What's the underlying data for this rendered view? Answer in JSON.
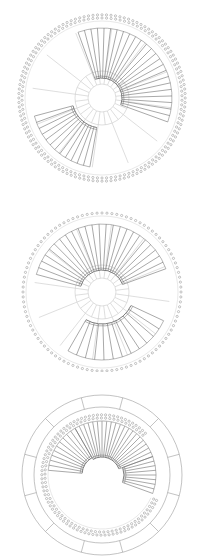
{
  "figure": {
    "panels": [
      {
        "id": "tree-1",
        "top": 0,
        "height": 186,
        "cx": 102,
        "cy": 98,
        "label_ring_r": 80,
        "leaf_r": 70,
        "inner_circles": [
          14,
          27
        ],
        "spokes": 12,
        "leaf_count": 110,
        "clades": [
          {
            "start": 190,
            "end": 255,
            "base_r": 30,
            "leaves": 12
          },
          {
            "start": 340,
            "end": 470,
            "base_r": 20,
            "leaves": 24
          }
        ],
        "label_rows": 2
      },
      {
        "id": "tree-2",
        "top": 186,
        "height": 186,
        "cx": 102,
        "cy": 292,
        "label_ring_r": 79,
        "leaf_r": 68,
        "inner_circles": [
          14,
          27
        ],
        "spokes": 12,
        "leaf_count": 100,
        "clades": [
          {
            "start": 285,
            "end": 430,
            "base_r": 22,
            "leaves": 24
          },
          {
            "start": 115,
            "end": 210,
            "base_r": 32,
            "leaves": 12
          }
        ],
        "label_rows": 1
      },
      {
        "id": "tree-3",
        "top": 372,
        "height": 186,
        "cx": 102,
        "cy": 475,
        "outer_ring_r": [
          80,
          68
        ],
        "ring_segments": 12,
        "label_ring_r": 57,
        "leaf_r": 54,
        "inner_circles": [],
        "spokes": 0,
        "leaf_count": 70,
        "arc": {
          "start": 115,
          "end": 410
        },
        "clades": [
          {
            "start": 275,
            "end": 330,
            "base_r": 20,
            "leaves": 10
          },
          {
            "start": 330,
            "end": 430,
            "base_r": 18,
            "leaves": 20
          },
          {
            "start": 430,
            "end": 470,
            "base_r": 22,
            "leaves": 8
          }
        ],
        "label_rows": 2
      }
    ],
    "colors": {
      "branch": "#6e6e6e",
      "spoke": "#d0d0d0",
      "label": "#8a8a8a",
      "ring": "#9a9a9a"
    }
  }
}
